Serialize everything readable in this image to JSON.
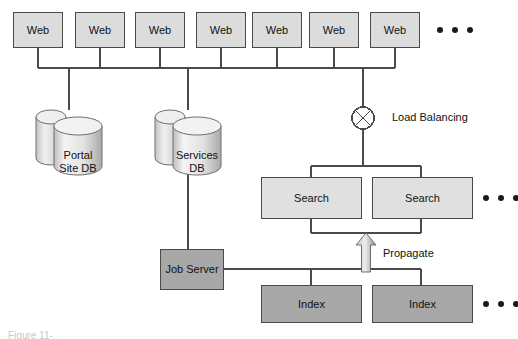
{
  "diagram": {
    "colors": {
      "web_fill": "#dcdcdc",
      "search_fill": "#e0e0e0",
      "index_fill": "#a8a8a8",
      "job_fill": "#a8a8a8",
      "line": "#4a4a4a",
      "text": "#111111",
      "arrow_fill": "#b0b0b0",
      "background": "#ffffff"
    },
    "web_tier": {
      "label": "Web",
      "count": 7,
      "nodes": [
        {
          "label": "Web"
        },
        {
          "label": "Web"
        },
        {
          "label": "Web"
        },
        {
          "label": "Web"
        },
        {
          "label": "Web"
        },
        {
          "label": "Web"
        },
        {
          "label": "Web"
        }
      ],
      "ellipsis": "..."
    },
    "databases": [
      {
        "name": "portal-site-db",
        "line1": "Portal",
        "line2": "Site DB"
      },
      {
        "name": "services-db",
        "line1": "Services",
        "line2": "DB"
      }
    ],
    "load_balancer": {
      "label": "Load Balancing",
      "symbol": "crossed-circle"
    },
    "search_tier": {
      "label": "Search",
      "count": 2,
      "nodes": [
        {
          "label": "Search"
        },
        {
          "label": "Search"
        }
      ],
      "ellipsis": "..."
    },
    "index_tier": {
      "label": "Index",
      "count": 2,
      "nodes": [
        {
          "label": "Index"
        },
        {
          "label": "Index"
        }
      ],
      "ellipsis": "..."
    },
    "job_server": {
      "label": "Job Server"
    },
    "propagate": {
      "label": "Propagate",
      "direction": "up"
    },
    "figure_caption": "Figure 11-"
  }
}
